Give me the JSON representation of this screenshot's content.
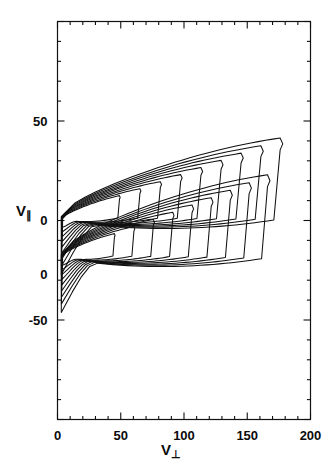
{
  "figure": {
    "type": "contour-plot",
    "background": "#ffffff",
    "line_color": "#111111"
  },
  "axes": {
    "x": {
      "label_base": "V",
      "label_sub": "⊥",
      "label_full": "V⊥",
      "min": 0,
      "max": 200,
      "major_ticks": [
        0,
        50,
        100,
        150,
        200
      ],
      "tick_labels": [
        "0",
        "50",
        "100",
        "150",
        "200"
      ],
      "minor_step": 10
    },
    "y": {
      "label_base": "V",
      "label_sub": "∥",
      "label_full": "V∥",
      "min": -100,
      "max": 100,
      "major_ticks": [
        -50,
        0,
        50
      ],
      "tick_labels_top_panel": [
        "50",
        "0"
      ],
      "tick_labels_bottom_panel": [
        "0",
        "-50"
      ],
      "minor_step": 10,
      "note_two_panels": "two stacked distributions each centered near 0"
    }
  },
  "chart_data": {
    "type": "contour",
    "title": "",
    "xlabel": "V⊥",
    "ylabel": "V∥",
    "xlim": [
      0,
      200
    ],
    "ylim": [
      -100,
      100
    ],
    "grid": false,
    "legend": "none",
    "n_levels": 9,
    "levels": [
      0.1,
      0.2,
      0.3,
      0.4,
      0.5,
      0.6,
      0.7,
      0.8,
      0.9
    ],
    "lobes": [
      {
        "name": "upper-lobe",
        "peak_vperp": 6,
        "peak_vpar": 3,
        "vperp_extent": [
          0,
          176
        ],
        "vpar_extent": [
          -42,
          41
        ],
        "description": "crescent shaped nested contours opening toward large V-perp, outermost contour reaches V-perp 176"
      },
      {
        "name": "lower-lobe",
        "peak_vperp": 6,
        "peak_vpar": -14,
        "vperp_extent": [
          0,
          166
        ],
        "vpar_extent": [
          -57,
          22
        ],
        "description": "crescent shaped nested contours mirroring upper lobe, outermost contour reaches V-perp 166"
      }
    ]
  }
}
